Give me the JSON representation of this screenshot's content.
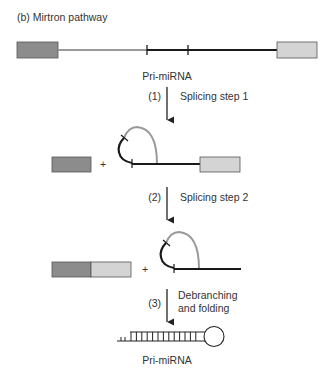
{
  "title": "(b) Mirtron pathway",
  "colors": {
    "exon_left": "#8c8c8c",
    "exon_right": "#d4d4d4",
    "intron_flank": "#9a9a9a",
    "mirna_strand": "#1a1a1a",
    "loop": "#999999",
    "outline": "#555555"
  },
  "top_construct_label": "Pri-miRNA",
  "steps": [
    {
      "number": "(1)",
      "label_lines": [
        "Splicing step 1"
      ]
    },
    {
      "number": "(2)",
      "label_lines": [
        "Splicing step 2"
      ]
    },
    {
      "number": "(3)",
      "label_lines": [
        "Debranching",
        "and folding"
      ]
    }
  ],
  "plus_sign": "+",
  "final_product_label": "Pri-miRNA"
}
